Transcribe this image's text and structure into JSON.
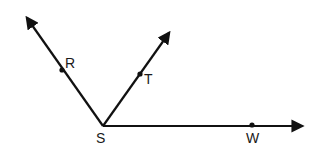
{
  "diagram": {
    "type": "geometry-rays",
    "stroke_color": "#111111",
    "vertex": {
      "label": "S",
      "x": 103,
      "y": 126,
      "label_x": 96,
      "label_y": 143
    },
    "rays": [
      {
        "name": "SR",
        "tip_x": 27,
        "tip_y": 18,
        "point": {
          "label": "R",
          "x": 62,
          "y": 70,
          "label_x": 65,
          "label_y": 68
        }
      },
      {
        "name": "ST",
        "tip_x": 169,
        "tip_y": 33,
        "point": {
          "label": "T",
          "x": 140,
          "y": 74,
          "label_x": 144,
          "label_y": 84
        }
      },
      {
        "name": "SW",
        "tip_x": 302,
        "tip_y": 126,
        "point": {
          "label": "W",
          "x": 252,
          "y": 125,
          "label_x": 246,
          "label_y": 143
        }
      }
    ]
  }
}
